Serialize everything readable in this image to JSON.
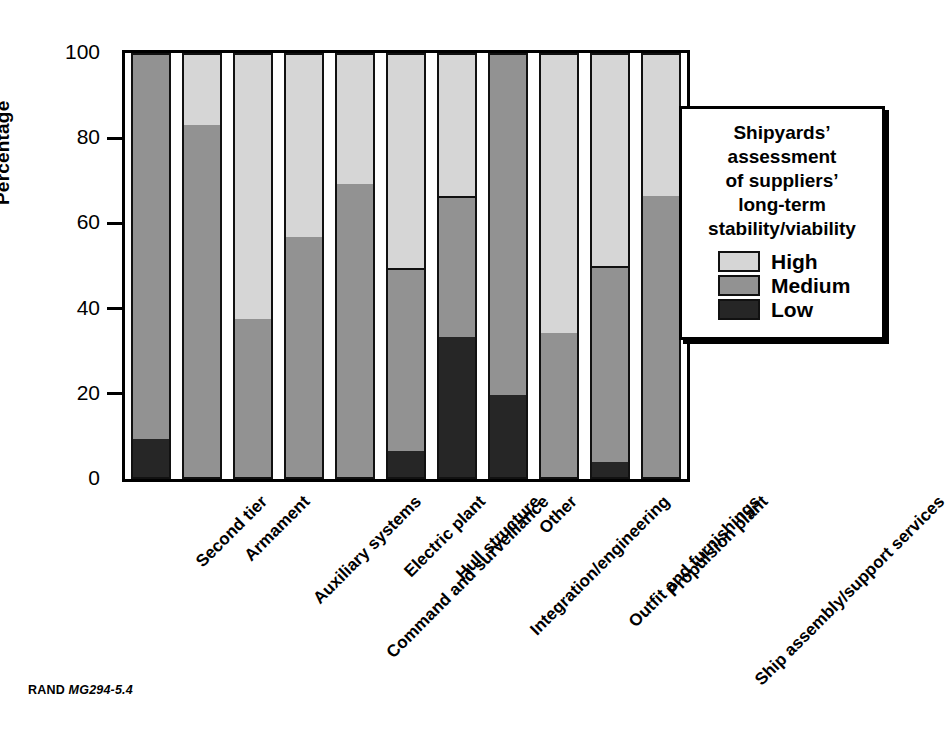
{
  "chart_data": {
    "type": "bar",
    "subtype": "stacked-bar-100-percent",
    "title": "",
    "xlabel": "",
    "ylabel": "Percentage",
    "ylim": [
      0,
      100
    ],
    "yticks": [
      0,
      20,
      40,
      60,
      80,
      100
    ],
    "ytick_labels": [
      "0",
      "20",
      "40",
      "60",
      "80",
      "100"
    ],
    "grid": false,
    "legend_position": "right-inside",
    "legend_title": "Shipyards’ assessment of suppliers’ long-term stability/viability",
    "legend_title_lines": [
      "Shipyards’",
      "assessment",
      "of suppliers’",
      "long-term",
      "stability/viability"
    ],
    "categories": [
      "Second tier",
      "Armament",
      "Auxiliary systems",
      "Command and surveillance",
      "Electric plant",
      "Hull structure",
      "Integration/engineering",
      "Other",
      "Outfit and furnishings",
      "Propulsion plant",
      "Ship assembly/support services"
    ],
    "series": [
      {
        "name": "Low",
        "color": "#262626",
        "values": [
          9.3,
          0,
          0,
          0,
          0,
          6.5,
          33.4,
          19.7,
          0,
          3.9,
          0
        ]
      },
      {
        "name": "Medium",
        "color": "#929292",
        "values": [
          90.7,
          83.1,
          37.5,
          56.7,
          69.3,
          43.0,
          33.0,
          80.3,
          34.3,
          46.2,
          66.4
        ]
      },
      {
        "name": "High",
        "color": "#d6d6d6",
        "values": [
          0,
          16.9,
          62.5,
          43.3,
          30.7,
          50.5,
          33.6,
          0,
          65.7,
          49.9,
          33.6
        ]
      }
    ],
    "cumulative_boundaries": {
      "note": "stack tops, bottom-up: Low top, Medium top (=Low+Medium), total always 100",
      "Second tier": {
        "low_top": 9.3,
        "medium_top": 100.0
      },
      "Armament": {
        "low_top": 0,
        "medium_top": 83.1
      },
      "Auxiliary systems": {
        "low_top": 0,
        "medium_top": 37.5
      },
      "Command and surveillance": {
        "low_top": 0,
        "medium_top": 56.7
      },
      "Electric plant": {
        "low_top": 0,
        "medium_top": 69.3
      },
      "Hull structure": {
        "low_top": 6.5,
        "medium_top": 49.5
      },
      "Integration/engineering": {
        "low_top": 33.4,
        "medium_top": 66.4
      },
      "Other": {
        "low_top": 19.7,
        "medium_top": 100.0
      },
      "Outfit and furnishings": {
        "low_top": 0,
        "medium_top": 34.3
      },
      "Propulsion plant": {
        "low_top": 3.9,
        "medium_top": 50.1
      },
      "Ship assembly/support services": {
        "low_top": 0,
        "medium_top": 66.4
      }
    }
  },
  "legend": {
    "entries": [
      {
        "label": "High",
        "swatch": "high"
      },
      {
        "label": "Medium",
        "swatch": "medium"
      },
      {
        "label": "Low",
        "swatch": "low"
      }
    ]
  },
  "footer": {
    "organization": "RAND",
    "figure_id": "MG294-5.4"
  },
  "colors": {
    "high": "#d6d6d6",
    "medium": "#929292",
    "low": "#262626",
    "axis": "#000000",
    "background": "#ffffff"
  }
}
